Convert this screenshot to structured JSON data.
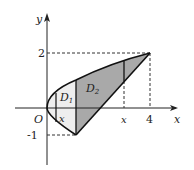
{
  "diagram": {
    "axes": {
      "x_label": "x",
      "y_label": "y",
      "origin_label": "O"
    },
    "ticks": {
      "y_top": "2",
      "y_bottom": "-1",
      "x_right": "4"
    },
    "regions": {
      "d1": "D",
      "d1_sub": "1",
      "d2": "D",
      "d2_sub": "2"
    },
    "vertical_lines": {
      "left_x": "x",
      "right_x": "x"
    },
    "colors": {
      "d1_fill": "#eeeeee",
      "d2_fill": "#a9a9a9",
      "stroke": "#111111"
    },
    "curves": [
      "y^2 = x (parabola from (1,-1) through O to (4,2))",
      "line y = x - 2 from (1,-1) to (4,2)"
    ]
  }
}
